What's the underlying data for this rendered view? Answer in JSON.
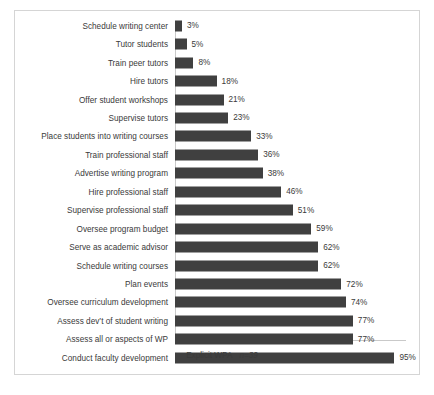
{
  "chart_data": {
    "type": "bar",
    "orientation": "horizontal",
    "title": "",
    "subtitle": "",
    "xlabel": "",
    "ylabel": "",
    "xlim": [
      0,
      100
    ],
    "grid": false,
    "legend_position": "bottom",
    "value_suffix": "%",
    "categories": [
      "Schedule writing center",
      "Tutor students",
      "Train peer tutors",
      "Hire tutors",
      "Offer student workshops",
      "Supervise tutors",
      "Place students into writing courses",
      "Train professional staff",
      "Advertise writing program",
      "Hire professional staff",
      "Supervise professional staff",
      "Oversee program budget",
      "Serve as academic advisor",
      "Schedule writing courses",
      "Plan events",
      "Oversee curriculum development",
      "Assess dev’t of student writing",
      "Assess all or aspects of WP",
      "Conduct faculty development"
    ],
    "values": [
      3,
      5,
      8,
      18,
      21,
      23,
      33,
      36,
      38,
      46,
      51,
      59,
      62,
      62,
      72,
      74,
      77,
      77,
      95
    ],
    "data_labels": [
      "3%",
      "5%",
      "8%",
      "18%",
      "21%",
      "23%",
      "33%",
      "36%",
      "38%",
      "46%",
      "51%",
      "59%",
      "62%",
      "62%",
      "72%",
      "74%",
      "77%",
      "77%",
      "95%"
    ],
    "series": [
      {
        "name": "Explicit WPA",
        "n_label": "n=39",
        "color": "#404040",
        "values": [
          3,
          5,
          8,
          18,
          21,
          23,
          33,
          36,
          38,
          46,
          51,
          59,
          62,
          62,
          72,
          74,
          77,
          77,
          95
        ]
      }
    ]
  },
  "legend": {
    "label": "Explicit WPA",
    "n_label": "n=39",
    "swatch_color": "#404040"
  },
  "colors": {
    "bar": "#404040",
    "axis": "#c9c9c9",
    "frame": "#d5d5d5",
    "text": "#3a3a3a",
    "background": "#ffffff"
  }
}
